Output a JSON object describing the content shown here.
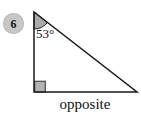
{
  "problem": {
    "number": "6"
  },
  "diagram": {
    "type": "right-triangle",
    "angle_label": "53°",
    "angle_value_degrees": 53,
    "side_label": "opposite",
    "right_angle_corner": "bottom-left",
    "angle_vertex": "top"
  },
  "colors": {
    "line": "#1a1a1a",
    "shade_fill": "#aaaaaa",
    "right_angle_fill": "#b3b3b3",
    "badge_fill": "#c7c7c7",
    "text": "#101010",
    "background": "#ffffff"
  }
}
